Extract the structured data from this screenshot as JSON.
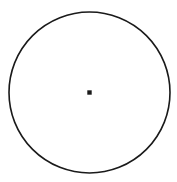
{
  "figure": {
    "name": "circle-divided-into-sectors",
    "canvas": {
      "width": 177,
      "height": 182,
      "background": "#ffffff"
    },
    "colors": {
      "background": "#ffffff",
      "outline": "#1a1a1a",
      "spoke": "#5a5a5a",
      "center_dot": "#1a1a1a",
      "interior_fill": "#ffffff"
    }
  },
  "chart_data": {
    "type": "pie",
    "title": "",
    "subtitle": "",
    "xlabel": "",
    "ylabel": "",
    "legend": [],
    "annotations": [],
    "grid": false,
    "labels_shown": false,
    "values_shown": false,
    "sector_count": 8,
    "center": {
      "x": 89.5,
      "y": 92.5
    },
    "radius": 80.5,
    "outline_width": 1.6,
    "spoke_width": 0.9,
    "center_dot_radius": 2.2,
    "categories": [
      "sector-1",
      "sector-2",
      "sector-3",
      "sector-4",
      "sector-5",
      "sector-6",
      "sector-7",
      "sector-8"
    ],
    "spoke_angles_deg": [
      -104,
      -67,
      -23,
      24,
      67,
      113,
      157,
      -154
    ],
    "spoke_endpoints": [
      {
        "name": "spoke-up-left",
        "x": 70,
        "y": 17
      },
      {
        "name": "spoke-up-right",
        "x": 121,
        "y": 20
      },
      {
        "name": "spoke-right-upper",
        "x": 158,
        "y": 62
      },
      {
        "name": "spoke-right-lower",
        "x": 157,
        "y": 122
      },
      {
        "name": "spoke-down-right",
        "x": 120,
        "y": 164
      },
      {
        "name": "spoke-down-left",
        "x": 58,
        "y": 165
      },
      {
        "name": "spoke-left-lower",
        "x": 22,
        "y": 123
      },
      {
        "name": "spoke-left-upper",
        "x": 22,
        "y": 60
      }
    ],
    "sector_sweeps_deg": [
      37,
      44,
      47,
      43,
      46,
      44,
      43,
      50
    ],
    "values": [
      37,
      44,
      47,
      43,
      46,
      44,
      43,
      50
    ]
  }
}
